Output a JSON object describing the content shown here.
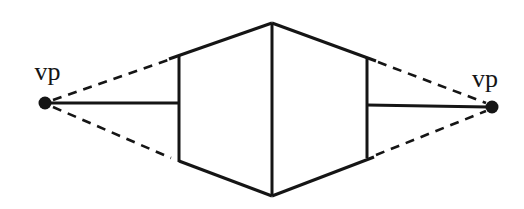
{
  "page": {
    "background": "#ffffff"
  },
  "diagram": {
    "name": "two-point-perspective-box",
    "canvas": {
      "width": 524,
      "height": 209
    },
    "ink_color": "#151515",
    "line_width": 3,
    "dashed_line_width": 2.6,
    "dash_pattern": "9 7",
    "labels": [
      {
        "id": "vp-left-label",
        "text": "vp",
        "x": 47.5,
        "y": 80,
        "font_size": 26
      },
      {
        "id": "vp-right-label",
        "text": "vp",
        "x": 485,
        "y": 87,
        "font_size": 26
      }
    ],
    "dots": [
      {
        "id": "vp-left-dot",
        "x": 45,
        "y": 103,
        "r": 6.5
      },
      {
        "id": "vp-right-dot",
        "x": 492,
        "y": 107,
        "r": 6.5
      }
    ],
    "solid_lines": [
      {
        "id": "box-front-vertical-edge",
        "x1": 272,
        "y1": 23,
        "x2": 272,
        "y2": 196
      },
      {
        "id": "box-top-left-edge",
        "x1": 272,
        "y1": 23,
        "x2": 169,
        "y2": 59
      },
      {
        "id": "box-top-right-edge",
        "x1": 272,
        "y1": 23,
        "x2": 376,
        "y2": 61
      },
      {
        "id": "box-left-vertical-edge",
        "x1": 179,
        "y1": 56,
        "x2": 179,
        "y2": 162
      },
      {
        "id": "box-right-vertical-edge",
        "x1": 367,
        "y1": 58,
        "x2": 367,
        "y2": 158
      },
      {
        "id": "box-bottom-left-edge",
        "x1": 179,
        "y1": 161,
        "x2": 272,
        "y2": 196
      },
      {
        "id": "box-bottom-right-edge",
        "x1": 272,
        "y1": 196,
        "x2": 374,
        "y2": 157
      },
      {
        "id": "horizon-line-left",
        "x1": 49,
        "y1": 103,
        "x2": 179,
        "y2": 103
      },
      {
        "id": "horizon-line-right",
        "x1": 367,
        "y1": 105,
        "x2": 488,
        "y2": 107
      }
    ],
    "dashed_lines": [
      {
        "id": "guide-left-top",
        "x1": 53,
        "y1": 100,
        "x2": 174,
        "y2": 58
      },
      {
        "id": "guide-left-bottom",
        "x1": 53,
        "y1": 107,
        "x2": 171,
        "y2": 158
      },
      {
        "id": "guide-right-top",
        "x1": 378,
        "y1": 62,
        "x2": 486,
        "y2": 103
      },
      {
        "id": "guide-right-bottom",
        "x1": 376,
        "y1": 155,
        "x2": 486,
        "y2": 111
      }
    ]
  }
}
